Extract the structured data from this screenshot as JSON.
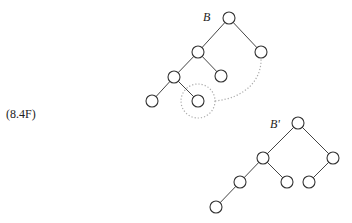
{
  "equation_label": "(8.4F)",
  "trees": [
    {
      "name": "B",
      "label": "B",
      "nodes": [
        "r",
        "a",
        "b",
        "c",
        "d",
        "e",
        "f"
      ],
      "edges": [
        [
          "r",
          "a"
        ],
        [
          "r",
          "b"
        ],
        [
          "a",
          "c"
        ],
        [
          "a",
          "d"
        ],
        [
          "c",
          "e"
        ],
        [
          "c",
          "f"
        ]
      ],
      "highlighted_node": "f",
      "dotted_link": [
        "f",
        "b"
      ]
    },
    {
      "name": "B-prime",
      "label": "B'",
      "nodes": [
        "r",
        "a",
        "b",
        "c",
        "d",
        "g",
        "e"
      ],
      "edges": [
        [
          "r",
          "a"
        ],
        [
          "r",
          "b"
        ],
        [
          "a",
          "c"
        ],
        [
          "a",
          "d"
        ],
        [
          "b",
          "g"
        ],
        [
          "c",
          "e"
        ]
      ]
    }
  ]
}
